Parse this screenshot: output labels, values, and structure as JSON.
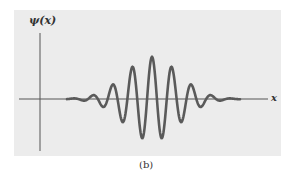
{
  "figure": {
    "y_axis_label": "ψ(x)",
    "x_axis_label": "x",
    "caption": "(b)",
    "colors": {
      "panel_background": "#ececec",
      "page_background": "#ffffff",
      "curve": "#555555",
      "axes": "#555555",
      "text": "#333333"
    }
  },
  "chart_data": {
    "type": "line",
    "title": "",
    "xlabel": "x",
    "ylabel": "ψ(x)",
    "grid": false,
    "legend": null,
    "annotations": [
      "(b)"
    ],
    "series": [
      {
        "name": "ψ(x)",
        "peaks_relative": [
          {
            "x": 74,
            "amp": 0.12
          },
          {
            "x": 93,
            "amp": 0.45
          },
          {
            "x": 113,
            "amp": 0.73
          },
          {
            "x": 132,
            "amp": 0.92
          },
          {
            "x": 152,
            "amp": 1.0
          },
          {
            "x": 172,
            "amp": 0.92
          },
          {
            "x": 191,
            "amp": 0.73
          },
          {
            "x": 213,
            "amp": 0.45
          },
          {
            "x": 234,
            "amp": 0.12
          }
        ],
        "center_x": 152,
        "wavelength_px": 19.7,
        "envelope": "gaussian",
        "x_range_px": [
          67,
          240
        ]
      }
    ]
  }
}
